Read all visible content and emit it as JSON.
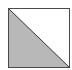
{
  "icon": {
    "name": "diagonal-split-square-icon",
    "colors": {
      "border": "#4a4a4a",
      "fill_lower_left": "#b8b8b8",
      "fill_upper_right": "#ffffff",
      "diagonal": "#333333"
    }
  }
}
